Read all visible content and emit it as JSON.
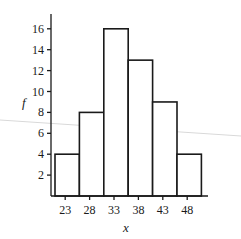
{
  "chart_data": {
    "type": "bar",
    "subtype": "histogram",
    "title": "",
    "xlabel": "x",
    "ylabel": "f",
    "categories": [
      "23",
      "28",
      "33",
      "38",
      "43",
      "48"
    ],
    "values": [
      4,
      8,
      16,
      13,
      9,
      4
    ],
    "y_ticks": [
      "2",
      "4",
      "6",
      "8",
      "10",
      "12",
      "14",
      "16"
    ],
    "ylim": [
      0,
      17
    ],
    "grid": false,
    "legend": null,
    "colors": {
      "bar_fill": "#ffffff",
      "bar_stroke": "#1a1a1a"
    }
  }
}
